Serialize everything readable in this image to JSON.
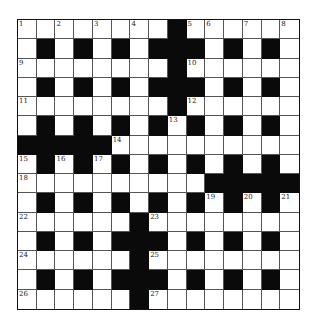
{
  "puzzle": {
    "size": 15,
    "colors": {
      "block": "#0a0a0a",
      "cell": "#ffffff",
      "line": "#555555",
      "border": "#111111"
    },
    "grid": [
      "........#......",
      ".#.#.#.###.#.#.",
      "........#......",
      ".#.#.#.###.#.#.",
      "........#......",
      ".#.#.#.#.#.#.#.",
      "#####..........",
      ".#.#.#.#.#.#.#.",
      "..........#####",
      ".#.#.#.#.#.#.#.",
      "......#........",
      ".#.#.###.#.#.#.",
      "......#........",
      ".#.#.###.#.#.#.",
      "......#........"
    ],
    "numbers": [
      {
        "row": 0,
        "col": 0,
        "n": "1"
      },
      {
        "row": 0,
        "col": 2,
        "n": "2"
      },
      {
        "row": 0,
        "col": 4,
        "n": "3"
      },
      {
        "row": 0,
        "col": 6,
        "n": "4"
      },
      {
        "row": 0,
        "col": 9,
        "n": "5"
      },
      {
        "row": 0,
        "col": 10,
        "n": "6"
      },
      {
        "row": 0,
        "col": 12,
        "n": "7"
      },
      {
        "row": 0,
        "col": 14,
        "n": "8"
      },
      {
        "row": 2,
        "col": 0,
        "n": "9"
      },
      {
        "row": 2,
        "col": 9,
        "n": "10"
      },
      {
        "row": 4,
        "col": 0,
        "n": "11"
      },
      {
        "row": 4,
        "col": 9,
        "n": "12"
      },
      {
        "row": 5,
        "col": 8,
        "n": "13"
      },
      {
        "row": 6,
        "col": 5,
        "n": "14"
      },
      {
        "row": 7,
        "col": 0,
        "n": "15"
      },
      {
        "row": 7,
        "col": 2,
        "n": "16"
      },
      {
        "row": 7,
        "col": 4,
        "n": "17"
      },
      {
        "row": 8,
        "col": 0,
        "n": "18"
      },
      {
        "row": 9,
        "col": 10,
        "n": "19"
      },
      {
        "row": 9,
        "col": 12,
        "n": "20"
      },
      {
        "row": 9,
        "col": 14,
        "n": "21"
      },
      {
        "row": 10,
        "col": 0,
        "n": "22"
      },
      {
        "row": 10,
        "col": 7,
        "n": "23"
      },
      {
        "row": 12,
        "col": 0,
        "n": "24"
      },
      {
        "row": 12,
        "col": 7,
        "n": "25"
      },
      {
        "row": 14,
        "col": 0,
        "n": "26"
      },
      {
        "row": 14,
        "col": 7,
        "n": "27"
      }
    ]
  }
}
